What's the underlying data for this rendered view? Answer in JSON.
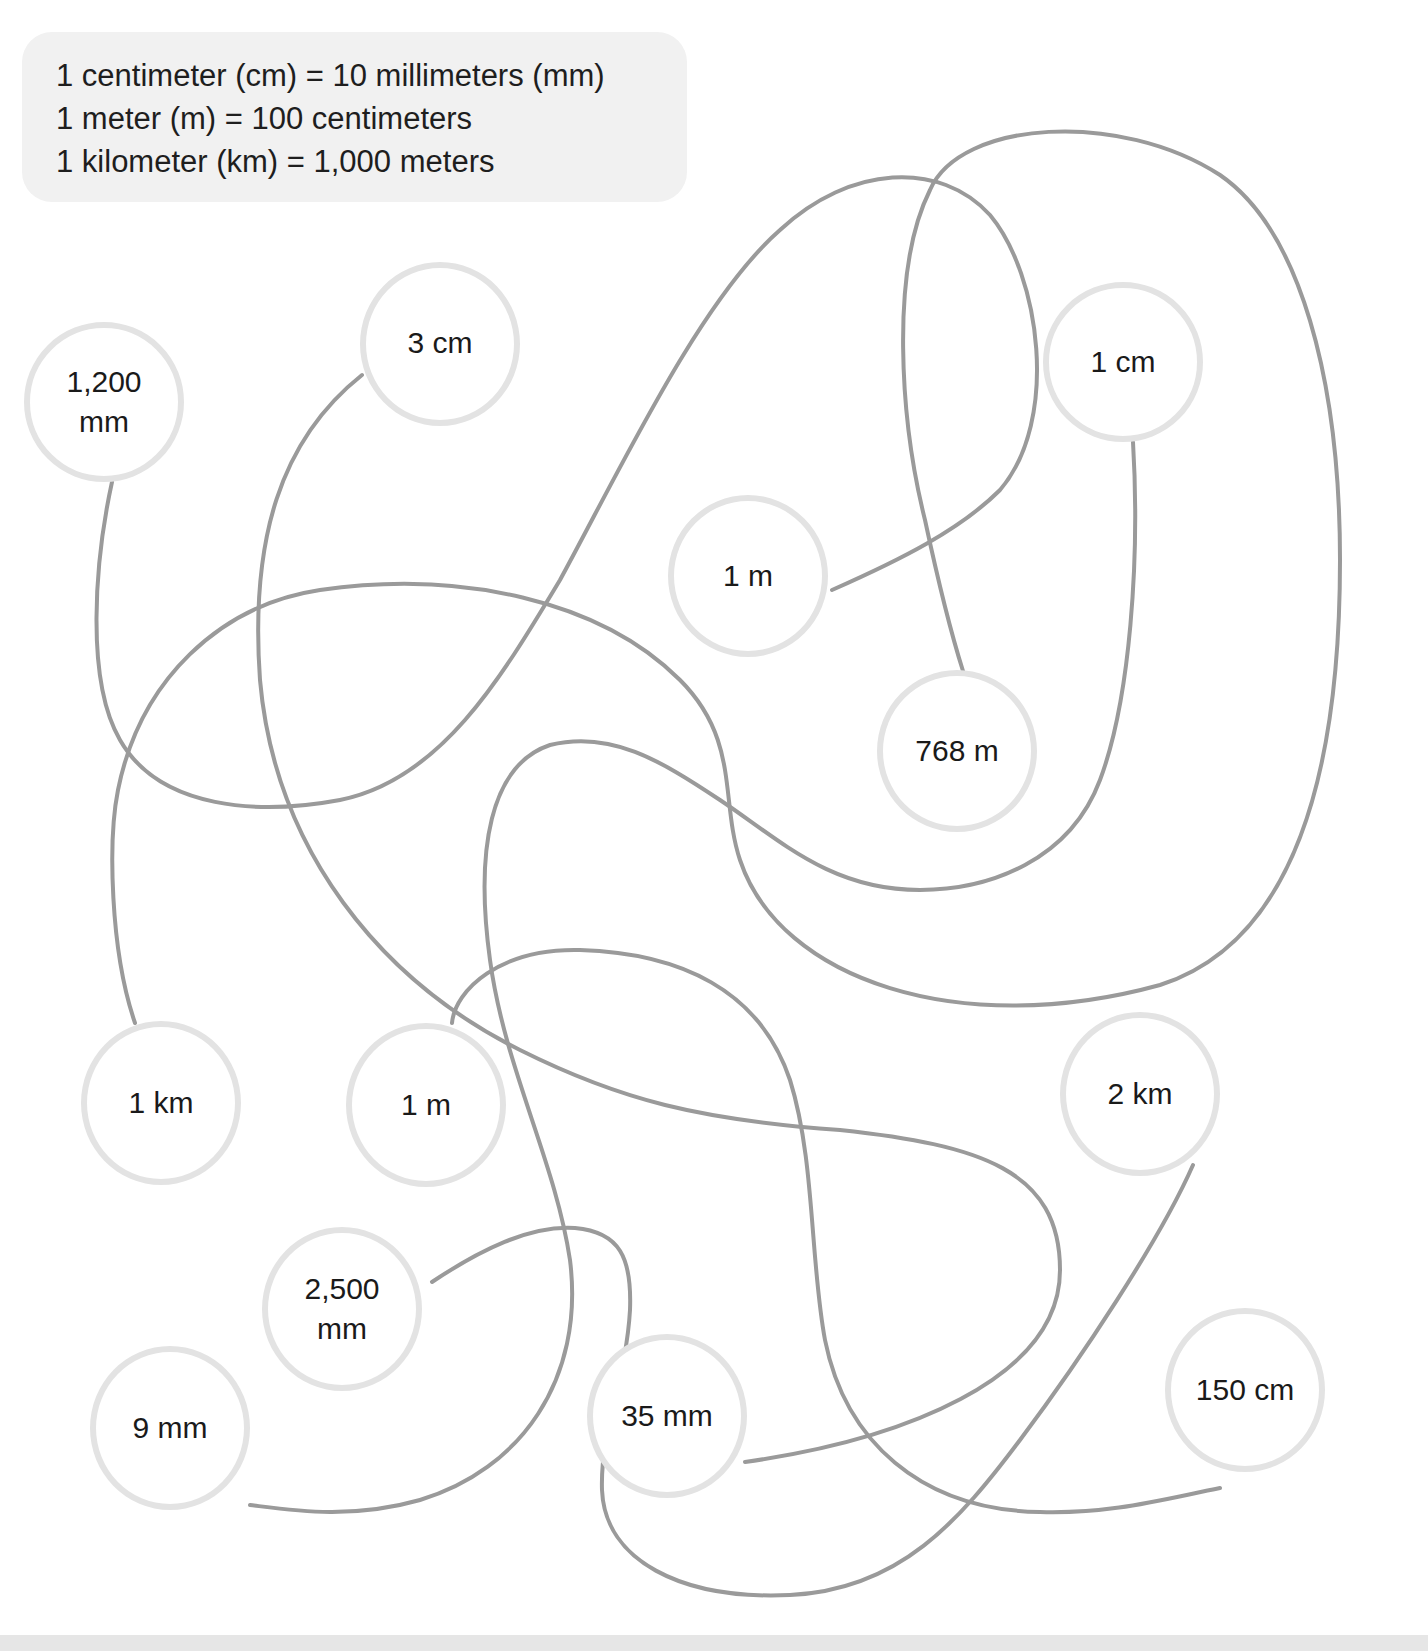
{
  "conversion_facts": [
    "1 centimeter (cm) = 10 millimeters (mm)",
    "1 meter (m) = 100 centimeters",
    "1 kilometer (km) = 1,000 meters"
  ],
  "colors": {
    "fact_box_bg": "#f1f1f1",
    "circle_border": "#e3e3e3",
    "path_stroke": "#9a9a9a",
    "text": "#1a1a1a"
  },
  "nodes": [
    {
      "id": "n1",
      "label": "1,200\nmm",
      "x": 104,
      "y": 402,
      "r": 80
    },
    {
      "id": "n2",
      "label": "3 cm",
      "x": 440,
      "y": 342,
      "r": 80
    },
    {
      "id": "n3",
      "label": "1 cm",
      "x": 1123,
      "y": 362,
      "r": 80
    },
    {
      "id": "n4",
      "label": "1 m",
      "x": 748,
      "y": 575,
      "r": 80
    },
    {
      "id": "n5",
      "label": "768 m",
      "x": 957,
      "y": 750,
      "r": 80
    },
    {
      "id": "n6",
      "label": "1 km",
      "x": 161,
      "y": 1101,
      "r": 80
    },
    {
      "id": "n7",
      "label": "1 m",
      "x": 426,
      "y": 1103,
      "r": 80
    },
    {
      "id": "n8",
      "label": "2 km",
      "x": 1140,
      "y": 1093,
      "r": 80
    },
    {
      "id": "n9",
      "label": "2,500\nmm",
      "x": 342,
      "y": 1307,
      "r": 80
    },
    {
      "id": "n10",
      "label": "9 mm",
      "x": 170,
      "y": 1426,
      "r": 80
    },
    {
      "id": "n11",
      "label": "35 mm",
      "x": 667,
      "y": 1414,
      "r": 80
    },
    {
      "id": "n12",
      "label": "150 cm",
      "x": 1245,
      "y": 1390,
      "r": 80
    }
  ],
  "connections": [
    {
      "from": "1,200 mm",
      "to": "1 m (upper)"
    },
    {
      "from": "3 cm",
      "to": "35 mm"
    },
    {
      "from": "1 km",
      "to": "768 m"
    },
    {
      "from": "1 cm",
      "to": "9 mm"
    },
    {
      "from": "1 m (lower)",
      "to": "150 cm"
    },
    {
      "from": "2,500 mm",
      "to": "2 km"
    }
  ]
}
